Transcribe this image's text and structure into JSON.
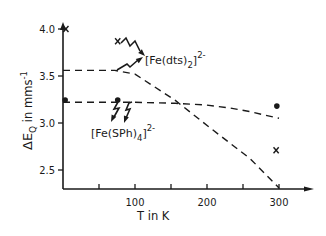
{
  "chart_data": {
    "type": "line",
    "title": "",
    "xlabel": "T in K",
    "ylabel": "ΔE_Q in mms⁻¹",
    "ylabel_parts": {
      "delta": "ΔE",
      "sub": "Q",
      "rest": " in mms",
      "sup": "-1"
    },
    "xlim": [
      0,
      340
    ],
    "ylim": [
      2.3,
      4.1
    ],
    "x_ticks": [
      50,
      100,
      150,
      200,
      250,
      300
    ],
    "x_tick_labels": [
      {
        "value": 100,
        "label": "100"
      },
      {
        "value": 200,
        "label": "200"
      },
      {
        "value": 300,
        "label": "300"
      }
    ],
    "y_ticks": [
      {
        "value": 4.0,
        "label": "4.0"
      },
      {
        "value": 3.5,
        "label": "3.5"
      },
      {
        "value": 3.0,
        "label": "3.0"
      },
      {
        "value": 2.5,
        "label": "2.5"
      }
    ],
    "grid": false,
    "series": [
      {
        "name": "[Fe(dts)2]2-",
        "style": "dashed",
        "x": [
          0,
          72,
          100,
          156,
          204,
          260,
          300
        ],
        "y": [
          3.56,
          3.56,
          3.52,
          3.24,
          2.95,
          2.62,
          2.31
        ],
        "markers": {
          "shape": "x",
          "points": [
            {
              "x": 4,
              "y": 4.0
            },
            {
              "x": 76,
              "y": 3.87
            },
            {
              "x": 296,
              "y": 2.71
            }
          ]
        }
      },
      {
        "name": "[Fe(SPh)4]2-",
        "style": "dashed",
        "x": [
          0,
          100,
          156,
          200,
          232,
          260,
          300
        ],
        "y": [
          3.22,
          3.22,
          3.21,
          3.19,
          3.16,
          3.12,
          3.05
        ],
        "markers": {
          "shape": "dot",
          "points": [
            {
              "x": 3,
              "y": 3.245
            },
            {
              "x": 76,
              "y": 3.245
            },
            {
              "x": 297,
              "y": 3.18
            }
          ]
        }
      }
    ],
    "annotations": [
      {
        "name": "dts-label",
        "text": "[Fe(dts)",
        "sub": "2",
        "close": "]",
        "sup": "2-"
      },
      {
        "name": "sph-label",
        "text": "[Fe(SPh)",
        "sub": "4",
        "close": "]",
        "sup": "2-"
      }
    ]
  }
}
